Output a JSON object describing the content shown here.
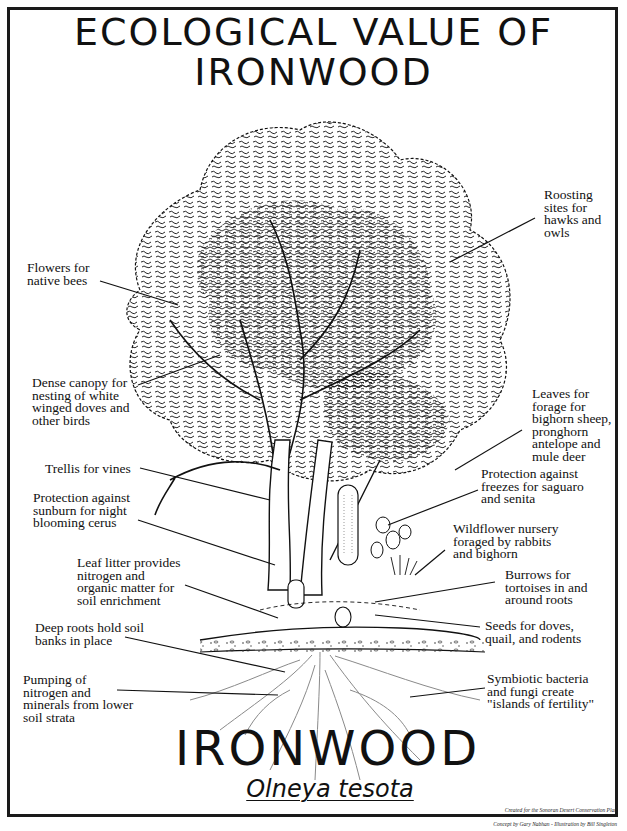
{
  "title": {
    "line1": "ECOLOGICAL VALUE OF",
    "line2": "IRONWOOD"
  },
  "common_name": "IRONWOOD",
  "scientific_name": "Olneya tesota",
  "credits": {
    "line1": "Created for the Sonoran Desert Conservation Plan",
    "line2": "Concept by Gary Nabhan - Illustration by Bill Singleton"
  },
  "illustration": {
    "subject": "ironwood-tree",
    "elements": [
      "tree-canopy",
      "trunks",
      "saguaro-cactus",
      "barrel-cactus",
      "prickly-pear",
      "wildflowers",
      "soil-layer",
      "root-system"
    ]
  },
  "labels_left": [
    {
      "id": "flowers",
      "text": "Flowers for\nnative bees"
    },
    {
      "id": "dense-canopy",
      "text": "Dense canopy for\nnesting of white\nwinged doves and\nother birds"
    },
    {
      "id": "trellis",
      "text": "Trellis for vines"
    },
    {
      "id": "sunburn",
      "text": "Protection against\nsunburn for night\nblooming cerus"
    },
    {
      "id": "leaf-litter",
      "text": "Leaf litter provides\nnitrogen and\norganic matter for\nsoil enrichment"
    },
    {
      "id": "deep-roots",
      "text": "Deep roots hold soil\nbanks in place"
    },
    {
      "id": "pumping",
      "text": "Pumping of\nnitrogen and\nminerals from lower\nsoil strata"
    }
  ],
  "labels_right": [
    {
      "id": "roosting",
      "text": "Roosting\nsites for\nhawks and\nowls"
    },
    {
      "id": "leaves",
      "text": "Leaves for\nforage for\nbighorn sheep,\npronghorn\nantelope and\nmule deer"
    },
    {
      "id": "freezes",
      "text": "Protection against\nfreezes for saguaro\nand senita"
    },
    {
      "id": "wildflower",
      "text": "Wildflower nursery\nforaged by rabbits\nand bighorn"
    },
    {
      "id": "burrows",
      "text": "Burrows for\ntortoises in and\naround roots"
    },
    {
      "id": "seeds",
      "text": "Seeds for doves,\nquail, and rodents"
    },
    {
      "id": "symbiotic",
      "text": "Symbiotic bacteria\nand fungi create\n\"islands of fertility\""
    }
  ],
  "colors": {
    "ink": "#111111",
    "background": "#ffffff",
    "root_gray": "#8a8a8a"
  }
}
